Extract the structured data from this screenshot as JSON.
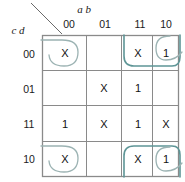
{
  "diagram": {
    "type": "karnaugh-map",
    "title": "",
    "col_axis_label": "a b",
    "row_axis_label": "c d",
    "col_headers": [
      "00",
      "01",
      "11",
      "10"
    ],
    "row_headers": [
      "00",
      "01",
      "11",
      "10"
    ],
    "cells": [
      [
        "X",
        "",
        "X",
        "1"
      ],
      [
        "",
        "X",
        "1",
        ""
      ],
      [
        "1",
        "X",
        "1",
        "X"
      ],
      [
        "X",
        "",
        "X",
        "1"
      ]
    ],
    "colors": {
      "grid": "#8a8a8a",
      "text": "#111111",
      "loop_gray": "#9cb3b3",
      "loop_teal": "#5e9596"
    },
    "groups": [
      {
        "name": "group-top-left-wrap",
        "style": "gray",
        "cells": [
          "r00c00"
        ]
      },
      {
        "name": "group-bottom-left-wrap",
        "style": "gray",
        "cells": [
          "r10c00"
        ]
      },
      {
        "name": "group-top-right-pair",
        "style": "teal",
        "cells": [
          "r00c11",
          "r00c10"
        ]
      },
      {
        "name": "group-top-right-single",
        "style": "gray",
        "cells": [
          "r00c10"
        ]
      },
      {
        "name": "group-bottom-right-pair",
        "style": "teal",
        "cells": [
          "r10c11",
          "r10c10"
        ]
      },
      {
        "name": "group-bottom-right-single",
        "style": "gray",
        "cells": [
          "r10c10"
        ]
      }
    ]
  }
}
